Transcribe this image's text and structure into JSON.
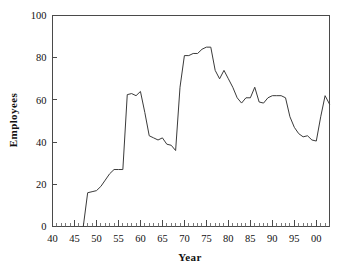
{
  "chart_data": {
    "type": "line",
    "title": "",
    "xlabel": "Year",
    "ylabel": "Employees",
    "xlim": [
      40,
      103
    ],
    "ylim": [
      0,
      100
    ],
    "grid": false,
    "legend": false,
    "x_tick_labels": [
      "40",
      "45",
      "50",
      "55",
      "60",
      "65",
      "70",
      "75",
      "80",
      "85",
      "90",
      "95",
      "00"
    ],
    "x_tick_values": [
      40,
      45,
      50,
      55,
      60,
      65,
      70,
      75,
      80,
      85,
      90,
      95,
      100
    ],
    "x_minor_tick_step": 1,
    "y_tick_labels": [
      "0",
      "20",
      "40",
      "60",
      "80",
      "100"
    ],
    "y_tick_values": [
      0,
      20,
      40,
      60,
      80,
      100
    ],
    "line_color": "#3a3a3a",
    "axis_color": "#4a4a4a",
    "background_color": "#ffffff",
    "series": [
      {
        "name": "Employees",
        "x": [
          47,
          48,
          49,
          50,
          51,
          52,
          53,
          54,
          55,
          56,
          57,
          58,
          59,
          60,
          61,
          62,
          63,
          64,
          65,
          66,
          67,
          68,
          69,
          70,
          71,
          72,
          73,
          74,
          75,
          76,
          77,
          78,
          79,
          80,
          81,
          82,
          83,
          84,
          85,
          86,
          87,
          88,
          89,
          90,
          91,
          92,
          93,
          94,
          95,
          96,
          97,
          98,
          99,
          100,
          101,
          102,
          103
        ],
        "values": [
          0,
          16,
          16.5,
          17,
          19,
          22,
          25,
          27,
          27,
          27,
          62.5,
          63,
          62,
          64,
          54,
          43,
          42,
          41,
          42,
          39,
          38.5,
          36,
          66,
          81,
          81,
          82,
          82,
          84,
          85,
          85,
          74,
          70,
          74,
          70,
          66,
          61,
          58.5,
          61,
          61,
          66,
          59,
          58.5,
          61,
          62,
          62,
          62,
          61,
          52,
          47,
          44,
          42.5,
          43,
          41,
          40.5,
          52,
          62,
          58
        ]
      }
    ]
  },
  "labels": {
    "x_axis_title": "Year",
    "y_axis_title": "Employees"
  }
}
